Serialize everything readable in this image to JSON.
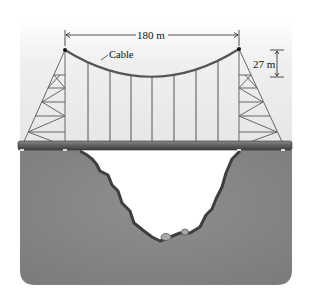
{
  "diagram": {
    "labels": {
      "span": "180 m",
      "sag": "27 m",
      "cable": "Cable"
    },
    "colors": {
      "sky": "#eeeeee",
      "ground": "#8a8a8a",
      "ground_dark": "#5a5a5a",
      "deck": "#6b6b6b",
      "cable": "#555555",
      "truss": "#666666"
    },
    "geometry": {
      "left_tower_top": [
        65,
        50
      ],
      "right_tower_top": [
        239,
        49
      ],
      "cable_lowest_point": [
        152,
        77
      ],
      "deck_y": 146,
      "hanger_x": [
        88,
        110,
        131,
        152,
        174,
        196,
        218
      ]
    }
  }
}
